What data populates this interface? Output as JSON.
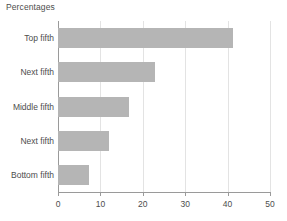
{
  "chart_data": {
    "type": "bar",
    "orientation": "horizontal",
    "title": "Percentages",
    "xlabel": "",
    "ylabel": "",
    "categories": [
      "Top fifth",
      "Next fifth",
      "Middle fifth",
      "Next fifth",
      "Bottom fifth"
    ],
    "values": [
      41.3,
      22.9,
      16.7,
      12.0,
      7.3
    ],
    "xlim": [
      0,
      50
    ],
    "xticks": [
      0,
      10,
      20,
      30,
      40,
      50
    ],
    "xtick_labels": [
      "0",
      "10",
      "20",
      "30",
      "40",
      "50"
    ],
    "grid": true,
    "grid_axis": "x",
    "legend": false,
    "bar_color": "#b5b5b5",
    "axis_color": "#9a9a9a",
    "grid_color": "#e3e3e3",
    "text_color": "#4d4d4d",
    "background": "#ffffff"
  }
}
